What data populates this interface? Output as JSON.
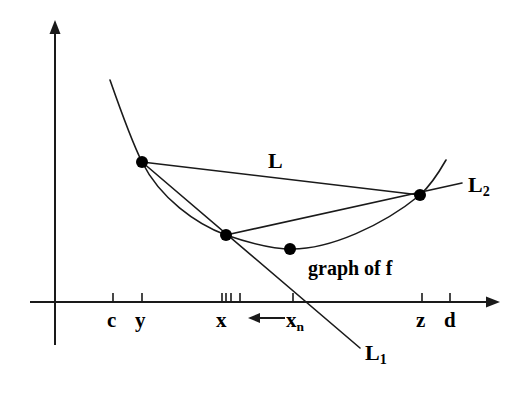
{
  "figure": {
    "background_color": "#ffffff",
    "stroke_color": "#1a1a1a",
    "point_color": "#000000"
  },
  "axes": {
    "x_axis_label": "",
    "y_axis_label": "",
    "x_axis_y": 302,
    "y_axis_x": 55,
    "x_axis_start": 30,
    "x_axis_end": 500,
    "y_axis_top": 20,
    "y_axis_bottom": 345
  },
  "tick_labels": [
    {
      "name": "c",
      "text": "c",
      "x": 113,
      "label_x": 107,
      "label_y": 310,
      "major": true
    },
    {
      "name": "y",
      "text": "y",
      "x": 142,
      "label_x": 135,
      "label_y": 310,
      "major": true
    },
    {
      "name": "x",
      "text": "x",
      "x": 222,
      "label_x": 216,
      "label_y": 310,
      "major": true
    },
    {
      "name": "xn",
      "text": "x",
      "subscript": "n",
      "x": 293,
      "label_x": 286,
      "label_y": 310,
      "major": true
    },
    {
      "name": "z",
      "text": "z",
      "x": 422,
      "label_x": 416,
      "label_y": 310,
      "major": true
    },
    {
      "name": "d",
      "text": "d",
      "x": 450,
      "label_x": 444,
      "label_y": 310,
      "major": true
    }
  ],
  "minor_ticks": [
    {
      "name": "tick-x-1",
      "x": 226
    },
    {
      "name": "tick-x-2",
      "x": 231
    },
    {
      "name": "tick-x-3",
      "x": 240
    }
  ],
  "arrow_annotation": {
    "name": "sequence-arrow",
    "label": "←",
    "from_x": 285,
    "to_x": 248,
    "y": 318,
    "meaning": "x_n converges to x"
  },
  "points": [
    {
      "name": "point-y",
      "label": "y",
      "x": 142,
      "y": 162,
      "r": 6
    },
    {
      "name": "point-x",
      "label": "x",
      "x": 226,
      "y": 235,
      "r": 6
    },
    {
      "name": "point-min",
      "label": "min",
      "x": 290,
      "y": 249,
      "r": 6
    },
    {
      "name": "point-z",
      "label": "z",
      "x": 420,
      "y": 195,
      "r": 6
    }
  ],
  "curve": {
    "name": "graph-of-f",
    "label": "graph of f",
    "label_x": 308,
    "label_y": 258,
    "path": "M 110,80 C 124,120 134,146 142,162 C 160,198 196,224 226,235 C 252,244 272,249 292,249 C 330,249 382,226 420,195 C 430,186 438,174 446,160"
  },
  "lines": [
    {
      "name": "line-L",
      "label": "L",
      "label_x": 268,
      "label_y": 150,
      "x1": 142,
      "y1": 162,
      "x2": 420,
      "y2": 195
    },
    {
      "name": "line-L1",
      "label": "L",
      "subscript": "1",
      "label_x": 365,
      "label_y": 342,
      "x1": 142,
      "y1": 162,
      "x2": 360,
      "y2": 348
    },
    {
      "name": "line-L2",
      "label": "L",
      "subscript": "2",
      "label_x": 468,
      "label_y": 174,
      "x1": 226,
      "y1": 235,
      "x2": 462,
      "y2": 183
    }
  ]
}
